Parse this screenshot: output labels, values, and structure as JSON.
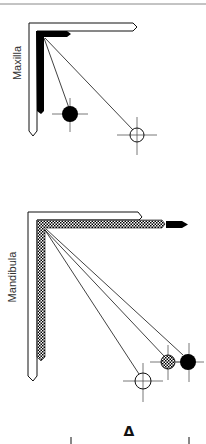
{
  "panels": [
    {
      "label": "Maxilla",
      "symbols": [
        "filled-circle",
        "open-circle"
      ]
    },
    {
      "label": "Mandibula",
      "symbols": [
        "open-circle",
        "hatched-circle",
        "filled-circle"
      ]
    }
  ],
  "footer": {
    "symbol": "Δ"
  },
  "colors": {
    "ink": "#111111",
    "rule": "#888888",
    "hatch": "#000000"
  }
}
